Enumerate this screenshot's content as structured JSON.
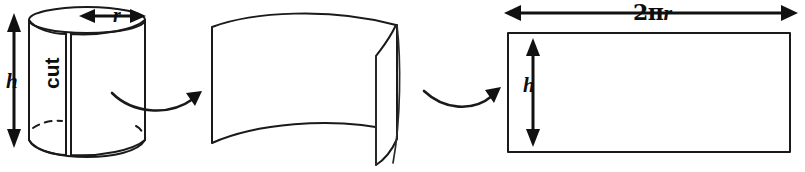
{
  "figure": {
    "background_color": "#ffffff",
    "stroke_color": "#1a1a1a",
    "width": 805,
    "height": 172
  },
  "panels": {
    "cylinder": {
      "name": "cylinder",
      "labels": {
        "height": "h",
        "radius": "r",
        "cut": "cut"
      }
    },
    "unrolled_surface": {
      "name": "partially unrolled lateral surface",
      "labels": {}
    },
    "rectangle": {
      "name": "flattened rectangle",
      "labels": {
        "width": "2πr",
        "width_prefix": "2",
        "width_pi": "π",
        "width_var": "r",
        "height": "h"
      }
    }
  },
  "icons": {
    "height_arrow_left": "double-headed-vertical-arrow-icon",
    "radius_arrow": "double-headed-horizontal-arrow-icon",
    "width_arrow": "double-headed-horizontal-arrow-icon",
    "height_arrow_rect": "double-headed-vertical-arrow-icon",
    "transform_arrow_1": "curved-right-arrow-icon",
    "transform_arrow_2": "curved-right-arrow-icon"
  }
}
